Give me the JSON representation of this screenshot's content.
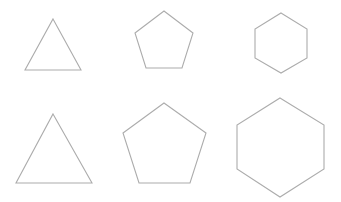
{
  "canvas": {
    "width": 341,
    "height": 202,
    "background": "#ffffff",
    "stroke_color": "#acacac"
  },
  "rows": [
    {
      "name": "top-row",
      "shapes": [
        {
          "type": "triangle",
          "sides": 3,
          "points": "53,19 81,70 25,70"
        },
        {
          "type": "pentagon",
          "sides": 5,
          "points": "164,11 193,33 182,68 146,68 135,33"
        },
        {
          "type": "hexagon",
          "sides": 6,
          "points": "281,13 307,29 307,58 281,73 255,58 255,29"
        }
      ]
    },
    {
      "name": "bottom-row",
      "shapes": [
        {
          "type": "triangle",
          "sides": 3,
          "points": "53,114 92,183 16,183"
        },
        {
          "type": "pentagon",
          "sides": 5,
          "points": "164,103 206,133 190,183 139,183 123,133"
        },
        {
          "type": "hexagon",
          "sides": 6,
          "points": "280,98 324,125 324,169 280,197 237,169 237,125"
        }
      ]
    }
  ]
}
